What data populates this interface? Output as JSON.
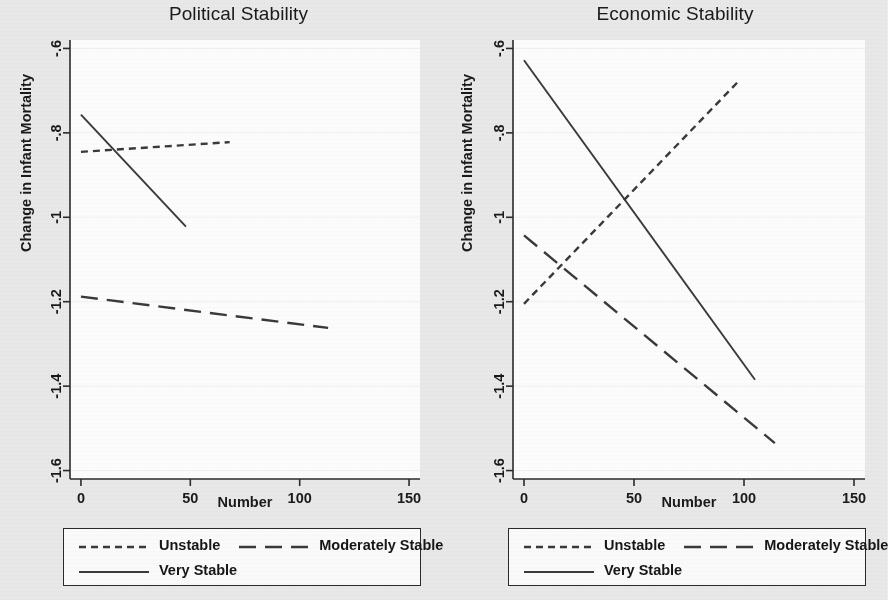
{
  "figure": {
    "background_color": "#ebebeb",
    "plot_background_color": "#ffffff",
    "line_color": "#3a3a3a"
  },
  "panels": [
    {
      "id": "political",
      "title": "Political Stability",
      "xlabel": "Number",
      "ylabel": "Change in Infant Mortality"
    },
    {
      "id": "economic",
      "title": "Economic Stability",
      "xlabel": "Number",
      "ylabel": "Change in Infant Mortality"
    }
  ],
  "axes": {
    "xticks": [
      0,
      50,
      100,
      150
    ],
    "xtick_labels": [
      "0",
      "50",
      "100",
      "150"
    ],
    "yticks": [
      -0.6,
      -0.8,
      -1.0,
      -1.2,
      -1.4,
      -1.6
    ],
    "ytick_labels": [
      "-.6",
      "-.8",
      "-1",
      "-1.2",
      "-1.4",
      "-1.6"
    ],
    "xlim": [
      -5,
      155
    ],
    "ylim": [
      -1.62,
      -0.58
    ]
  },
  "legend": {
    "entries": [
      {
        "label": "Unstable",
        "style": "dotted"
      },
      {
        "label": "Moderately Stable",
        "style": "dashed"
      },
      {
        "label": "Very Stable",
        "style": "solid"
      }
    ]
  },
  "chart_data": {
    "type": "line",
    "xlabel": "Number",
    "ylabel": "Change in Infant Mortality",
    "xlim": [
      -5,
      155
    ],
    "ylim": [
      -1.62,
      -0.58
    ],
    "grid": false,
    "legend_position": "below-panel",
    "panels": [
      {
        "title": "Political Stability",
        "series": [
          {
            "name": "Unstable",
            "style": "dotted",
            "x": [
              0,
              68
            ],
            "y": [
              -0.845,
              -0.822
            ]
          },
          {
            "name": "Moderately Stable",
            "style": "dashed",
            "x": [
              0,
              113
            ],
            "y": [
              -1.188,
              -1.262
            ]
          },
          {
            "name": "Very Stable",
            "style": "solid",
            "x": [
              0,
              48
            ],
            "y": [
              -0.757,
              -1.022
            ]
          }
        ]
      },
      {
        "title": "Economic Stability",
        "series": [
          {
            "name": "Unstable",
            "style": "dotted",
            "x": [
              0,
              98
            ],
            "y": [
              -1.205,
              -0.675
            ]
          },
          {
            "name": "Moderately Stable",
            "style": "dashed",
            "x": [
              0,
              114
            ],
            "y": [
              -1.043,
              -1.535
            ]
          },
          {
            "name": "Very Stable",
            "style": "solid",
            "x": [
              0,
              105
            ],
            "y": [
              -0.628,
              -1.385
            ]
          }
        ]
      }
    ]
  }
}
